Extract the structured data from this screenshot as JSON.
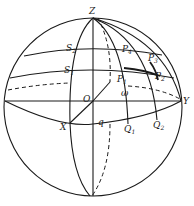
{
  "figure": {
    "stroke_color": "#1a1a1a",
    "background": "#ffffff"
  },
  "labels": {
    "Z": {
      "main": "Z",
      "sub": ""
    },
    "Y": {
      "main": "Y",
      "sub": ""
    },
    "X": {
      "main": "X",
      "sub": ""
    },
    "O": {
      "main": "O",
      "sub": ""
    },
    "S1": {
      "main": "S",
      "sub": "1"
    },
    "S2": {
      "main": "S",
      "sub": "2"
    },
    "P1": {
      "main": "P",
      "sub": "1"
    },
    "P2": {
      "main": "P",
      "sub": "2"
    },
    "P3": {
      "main": "P",
      "sub": "3"
    },
    "P4": {
      "main": "P",
      "sub": "4"
    },
    "Q1": {
      "main": "Q",
      "sub": "1"
    },
    "Q2": {
      "main": "Q",
      "sub": "2"
    },
    "omega": {
      "main": "ω",
      "sub": ""
    },
    "q": {
      "main": "q",
      "sub": ""
    }
  }
}
